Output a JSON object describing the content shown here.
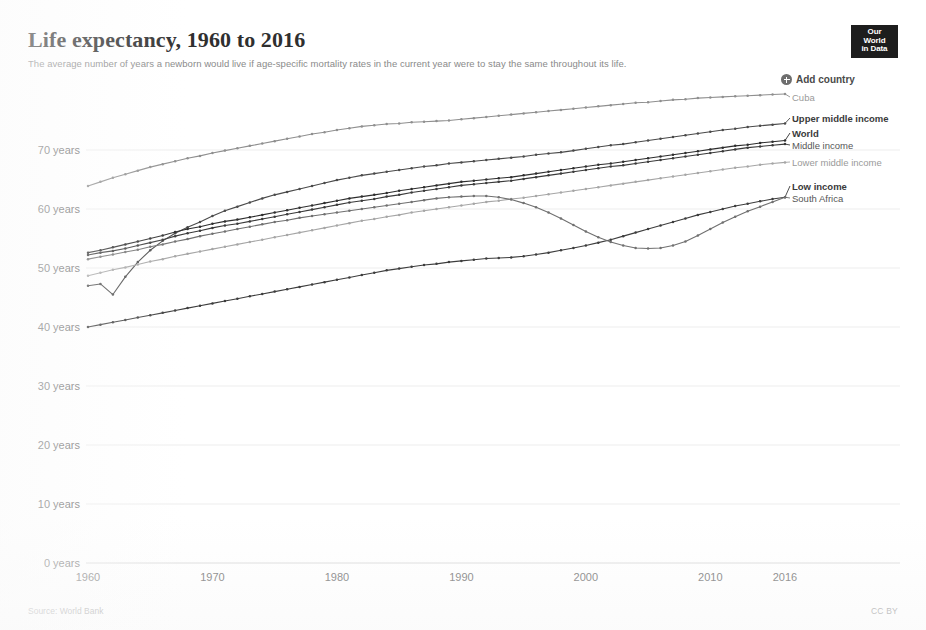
{
  "header": {
    "title": "Life expectancy, 1960 to 2016",
    "subtitle": "The average number of years a newborn would live if age-specific mortality rates in the current year were to stay the same throughout its life.",
    "logo_line1": "Our World",
    "logo_line2": "in Data"
  },
  "toolbar": {
    "add_country_label": "Add country",
    "add_country_icon": "plus-circle-icon"
  },
  "footer": {
    "source": "Source: World Bank",
    "license": "CC BY"
  },
  "colors": {
    "cuba": "#8f8f8f",
    "upper_middle_income": "#4a4a4a",
    "world": "#2e2e2e",
    "middle_income": "#3a3a3a",
    "lower_middle_income": "#a6a6a6",
    "low_income": "#3d3d3d",
    "south_africa": "#707070",
    "gridline": "#ededed",
    "axis_text": "#6f6f6f"
  },
  "chart_data": {
    "type": "line",
    "title": "Life expectancy, 1960 to 2016",
    "subtitle": "The average number of years a newborn would live if age-specific mortality rates in the current year were to stay the same throughout its life.",
    "xlabel": "",
    "ylabel": "",
    "xlim": [
      1960,
      2016
    ],
    "ylim": [
      0,
      75
    ],
    "grid": true,
    "legend_position": "right-inline",
    "y_ticks": [
      0,
      10,
      20,
      30,
      40,
      50,
      60,
      70
    ],
    "y_tick_labels": [
      "0 years",
      "10 years",
      "20 years",
      "30 years",
      "40 years",
      "50 years",
      "60 years",
      "70 years"
    ],
    "x_ticks": [
      1960,
      1970,
      1980,
      1990,
      2000,
      2010,
      2016
    ],
    "x_tick_labels": [
      "1960",
      "1970",
      "1980",
      "1990",
      "2000",
      "2010",
      "2016"
    ],
    "x": [
      1960,
      1961,
      1962,
      1963,
      1964,
      1965,
      1966,
      1967,
      1968,
      1969,
      1970,
      1971,
      1972,
      1973,
      1974,
      1975,
      1976,
      1977,
      1978,
      1979,
      1980,
      1981,
      1982,
      1983,
      1984,
      1985,
      1986,
      1987,
      1988,
      1989,
      1990,
      1991,
      1992,
      1993,
      1994,
      1995,
      1996,
      1997,
      1998,
      1999,
      2000,
      2001,
      2002,
      2003,
      2004,
      2005,
      2006,
      2007,
      2008,
      2009,
      2010,
      2011,
      2012,
      2013,
      2014,
      2015,
      2016
    ],
    "series": [
      {
        "name": "Cuba",
        "label_style": "light",
        "color": "#8f8f8f",
        "values": [
          63.9,
          64.6,
          65.3,
          65.9,
          66.5,
          67.1,
          67.6,
          68.1,
          68.6,
          69.0,
          69.5,
          69.9,
          70.3,
          70.7,
          71.1,
          71.5,
          71.9,
          72.3,
          72.7,
          73.0,
          73.4,
          73.7,
          74.0,
          74.2,
          74.4,
          74.5,
          74.7,
          74.8,
          74.9,
          75.0,
          75.2,
          75.4,
          75.6,
          75.8,
          76.0,
          76.2,
          76.4,
          76.6,
          76.8,
          77.0,
          77.2,
          77.4,
          77.6,
          77.8,
          78.0,
          78.1,
          78.3,
          78.5,
          78.6,
          78.8,
          78.9,
          79.0,
          79.1,
          79.2,
          79.3,
          79.4,
          79.5
        ]
      },
      {
        "name": "Upper middle income",
        "label_style": "bold",
        "color": "#4a4a4a",
        "values": [
          47.0,
          47.3,
          45.5,
          48.5,
          51.0,
          53.0,
          54.6,
          55.9,
          56.9,
          57.8,
          58.8,
          59.7,
          60.4,
          61.1,
          61.8,
          62.4,
          62.9,
          63.4,
          63.9,
          64.4,
          64.9,
          65.3,
          65.7,
          66.0,
          66.3,
          66.6,
          66.9,
          67.2,
          67.4,
          67.7,
          67.9,
          68.1,
          68.3,
          68.5,
          68.7,
          68.9,
          69.2,
          69.4,
          69.6,
          69.9,
          70.2,
          70.5,
          70.8,
          71.0,
          71.3,
          71.6,
          71.9,
          72.2,
          72.5,
          72.8,
          73.1,
          73.4,
          73.6,
          73.9,
          74.1,
          74.3,
          74.5
        ]
      },
      {
        "name": "World",
        "label_style": "bold",
        "color": "#2e2e2e",
        "values": [
          52.6,
          53.0,
          53.5,
          54.0,
          54.5,
          55.0,
          55.5,
          56.1,
          56.6,
          57.0,
          57.5,
          57.9,
          58.2,
          58.6,
          59.0,
          59.4,
          59.8,
          60.2,
          60.6,
          61.0,
          61.4,
          61.8,
          62.1,
          62.4,
          62.7,
          63.1,
          63.4,
          63.7,
          64.0,
          64.3,
          64.6,
          64.8,
          65.0,
          65.2,
          65.4,
          65.7,
          66.0,
          66.3,
          66.6,
          66.9,
          67.2,
          67.5,
          67.7,
          68.0,
          68.3,
          68.6,
          68.9,
          69.2,
          69.5,
          69.8,
          70.1,
          70.4,
          70.7,
          70.9,
          71.2,
          71.4,
          71.6
        ]
      },
      {
        "name": "Middle income",
        "label_style": "norm",
        "color": "#3a3a3a",
        "values": [
          52.2,
          52.6,
          52.9,
          53.3,
          53.8,
          54.3,
          54.8,
          55.4,
          55.9,
          56.3,
          56.8,
          57.2,
          57.5,
          57.9,
          58.3,
          58.7,
          59.1,
          59.5,
          59.9,
          60.3,
          60.7,
          61.1,
          61.4,
          61.7,
          62.1,
          62.4,
          62.8,
          63.1,
          63.4,
          63.7,
          64.0,
          64.2,
          64.4,
          64.6,
          64.8,
          65.1,
          65.4,
          65.7,
          66.0,
          66.3,
          66.6,
          66.9,
          67.2,
          67.4,
          67.7,
          68.0,
          68.3,
          68.6,
          68.9,
          69.2,
          69.5,
          69.8,
          70.1,
          70.4,
          70.6,
          70.8,
          71.0
        ]
      },
      {
        "name": "Lower middle income",
        "label_style": "light",
        "color": "#a6a6a6",
        "values": [
          48.7,
          49.2,
          49.7,
          50.1,
          50.6,
          51.1,
          51.5,
          52.0,
          52.4,
          52.8,
          53.2,
          53.6,
          54.0,
          54.4,
          54.8,
          55.2,
          55.6,
          56.0,
          56.4,
          56.8,
          57.2,
          57.6,
          58.0,
          58.3,
          58.7,
          59.0,
          59.4,
          59.7,
          60.0,
          60.3,
          60.6,
          60.9,
          61.2,
          61.4,
          61.7,
          61.9,
          62.2,
          62.5,
          62.8,
          63.1,
          63.4,
          63.7,
          64.0,
          64.3,
          64.6,
          64.9,
          65.2,
          65.5,
          65.8,
          66.1,
          66.4,
          66.7,
          67.0,
          67.2,
          67.5,
          67.7,
          67.9
        ]
      },
      {
        "name": "Low income",
        "label_style": "bold",
        "color": "#3d3d3d",
        "values": [
          40.0,
          40.4,
          40.8,
          41.2,
          41.6,
          42.0,
          42.4,
          42.8,
          43.2,
          43.6,
          44.0,
          44.4,
          44.8,
          45.2,
          45.6,
          46.0,
          46.4,
          46.8,
          47.2,
          47.6,
          48.0,
          48.4,
          48.8,
          49.2,
          49.6,
          49.9,
          50.2,
          50.5,
          50.7,
          51.0,
          51.2,
          51.4,
          51.6,
          51.7,
          51.8,
          52.0,
          52.3,
          52.6,
          53.0,
          53.4,
          53.8,
          54.3,
          54.8,
          55.4,
          56.0,
          56.6,
          57.2,
          57.8,
          58.4,
          59.0,
          59.5,
          60.0,
          60.5,
          60.9,
          61.3,
          61.7,
          62.0
        ]
      },
      {
        "name": "South Africa",
        "label_style": "norm",
        "color": "#707070",
        "values": [
          51.5,
          51.9,
          52.3,
          52.7,
          53.1,
          53.6,
          54.0,
          54.5,
          54.9,
          55.4,
          55.8,
          56.2,
          56.6,
          57.0,
          57.4,
          57.8,
          58.1,
          58.5,
          58.8,
          59.1,
          59.4,
          59.7,
          60.0,
          60.3,
          60.6,
          60.9,
          61.2,
          61.5,
          61.8,
          62.0,
          62.1,
          62.2,
          62.2,
          62.0,
          61.6,
          61.0,
          60.3,
          59.4,
          58.4,
          57.3,
          56.2,
          55.2,
          54.4,
          53.8,
          53.4,
          53.3,
          53.4,
          53.8,
          54.5,
          55.5,
          56.6,
          57.7,
          58.7,
          59.6,
          60.4,
          61.2,
          62.0
        ]
      }
    ]
  }
}
